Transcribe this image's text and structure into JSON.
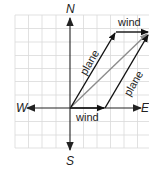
{
  "diagram": {
    "type": "vector-addition",
    "compass": {
      "north": "N",
      "south": "S",
      "east": "E",
      "west": "W"
    },
    "labels": {
      "wind_top": "wind",
      "wind_bottom": "wind",
      "plane_left": "plane",
      "plane_right": "plane"
    },
    "colors": {
      "grid": "#d9d9d9",
      "axis": "#222222",
      "vector": "#111111",
      "resultant": "#8c8c8c",
      "background": "#ffffff"
    },
    "vectors": [
      {
        "name": "wind",
        "from": [
          0,
          0
        ],
        "to": [
          2.6,
          0
        ],
        "color": "#111111"
      },
      {
        "name": "plane",
        "from": [
          0,
          0
        ],
        "to": [
          3.3,
          5.6
        ],
        "color": "#111111"
      },
      {
        "name": "wind",
        "from": [
          3.3,
          5.6
        ],
        "to": [
          5.8,
          5.6
        ],
        "color": "#111111"
      },
      {
        "name": "plane",
        "from": [
          2.6,
          0
        ],
        "to": [
          5.8,
          5.6
        ],
        "color": "#111111"
      },
      {
        "name": "resultant",
        "from": [
          0,
          0
        ],
        "to": [
          5.8,
          5.6
        ],
        "color": "#8c8c8c"
      }
    ]
  }
}
